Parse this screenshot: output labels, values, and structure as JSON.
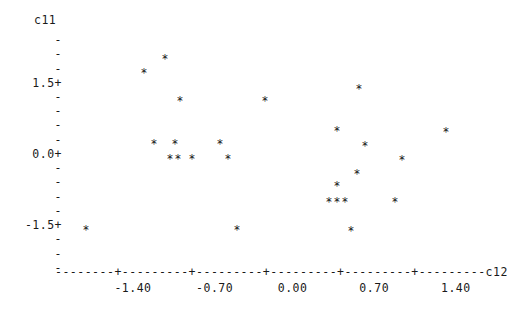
{
  "plot": {
    "type": "character-scatterplot",
    "marker_glyph": "*",
    "y_axis_title": "c11",
    "x_axis_title": "c12",
    "y_axis": {
      "labeled_ticks": [
        "1.5+",
        "0.0+",
        "-1.5+"
      ],
      "minor_tick_glyph": "-",
      "rows": [
        {
          "label": "",
          "glyph": "",
          "top": 13
        },
        {
          "label": "",
          "glyph": "-",
          "top": 33
        },
        {
          "label": "",
          "glyph": "-",
          "top": 47
        },
        {
          "label": "",
          "glyph": "-",
          "top": 62
        },
        {
          "label": "1.5+",
          "glyph": "",
          "top": 76
        },
        {
          "label": "",
          "glyph": "-",
          "top": 90
        },
        {
          "label": "",
          "glyph": "-",
          "top": 104
        },
        {
          "label": "",
          "glyph": "-",
          "top": 118
        },
        {
          "label": "",
          "glyph": "-",
          "top": 133
        },
        {
          "label": "0.0+",
          "glyph": "",
          "top": 147
        },
        {
          "label": "",
          "glyph": "-",
          "top": 161
        },
        {
          "label": "",
          "glyph": "-",
          "top": 175
        },
        {
          "label": "",
          "glyph": "-",
          "top": 190
        },
        {
          "label": "",
          "glyph": "-",
          "top": 204
        },
        {
          "label": "-1.5+",
          "glyph": "",
          "top": 218
        },
        {
          "label": "",
          "glyph": "-",
          "top": 232
        },
        {
          "label": "",
          "glyph": "-",
          "top": 247
        },
        {
          "label": "",
          "glyph": "-",
          "top": 261
        }
      ]
    },
    "x_axis": {
      "line": "--------+---------+---------+---------+---------+---------c12",
      "tick_label_line": "        -1.40      -0.70      0.00       0.70       1.40",
      "tick_labels": [
        "-1.40",
        "-0.70",
        "0.00",
        "0.70",
        "1.40"
      ]
    }
  },
  "chart_data": {
    "type": "scatter",
    "title": "",
    "xlabel": "c12",
    "ylabel": "c11",
    "xlim": [
      -2.1,
      2.1
    ],
    "ylim": [
      -2.1,
      2.1
    ],
    "grid": false,
    "legend": null,
    "xticks": [
      -1.4,
      -0.7,
      0.0,
      0.7,
      1.4
    ],
    "yticks": [
      1.5,
      0.0,
      -1.5
    ],
    "marker": "*",
    "n_points": 24,
    "points": [
      {
        "x": -1.73,
        "y": -1.77,
        "px": 86,
        "py": 231
      },
      {
        "x": -1.17,
        "y": 1.54,
        "px": 144,
        "py": 74
      },
      {
        "x": -0.97,
        "y": 1.84,
        "px": 165,
        "py": 60
      },
      {
        "x": -0.82,
        "y": 0.95,
        "px": 180,
        "py": 102
      },
      {
        "x": -1.07,
        "y": 0.04,
        "px": 154,
        "py": 145
      },
      {
        "x": -0.87,
        "y": 0.04,
        "px": 175,
        "py": 145
      },
      {
        "x": -0.92,
        "y": -0.27,
        "px": 170,
        "py": 160
      },
      {
        "x": -0.84,
        "y": -0.27,
        "px": 178,
        "py": 160
      },
      {
        "x": -0.71,
        "y": -0.27,
        "px": 192,
        "py": 160
      },
      {
        "x": -0.44,
        "y": 0.04,
        "px": 220,
        "py": 145
      },
      {
        "x": -0.37,
        "y": -0.27,
        "px": 228,
        "py": 160
      },
      {
        "x": -0.28,
        "y": -1.77,
        "px": 237,
        "py": 231
      },
      {
        "x": -0.01,
        "y": 0.95,
        "px": 265,
        "py": 102
      },
      {
        "x": 0.89,
        "y": 1.2,
        "px": 359,
        "py": 90
      },
      {
        "x": 0.68,
        "y": 0.32,
        "px": 337,
        "py": 132
      },
      {
        "x": 1.74,
        "y": 0.3,
        "px": 446,
        "py": 133
      },
      {
        "x": 0.95,
        "y": 0.0,
        "px": 365,
        "py": 147
      },
      {
        "x": 1.3,
        "y": -0.3,
        "px": 402,
        "py": 161
      },
      {
        "x": 0.91,
        "y": -0.59,
        "px": 357,
        "py": 175
      },
      {
        "x": 0.68,
        "y": -0.85,
        "px": 337,
        "py": 187
      },
      {
        "x": 0.6,
        "y": -1.18,
        "px": 329,
        "py": 203
      },
      {
        "x": 0.68,
        "y": -1.18,
        "px": 337,
        "py": 203
      },
      {
        "x": 0.76,
        "y": -1.18,
        "px": 345,
        "py": 203
      },
      {
        "x": 1.32,
        "y": -1.18,
        "px": 395,
        "py": 203
      },
      {
        "x": 0.82,
        "y": -1.8,
        "px": 351,
        "py": 232
      }
    ]
  }
}
